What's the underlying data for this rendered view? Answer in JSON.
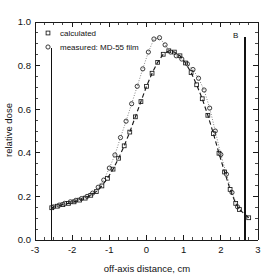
{
  "chart_data": {
    "type": "line",
    "title": "",
    "xlabel": "off-axis distance, cm",
    "ylabel": "relative dose",
    "xlim": [
      -3,
      3
    ],
    "ylim": [
      0.0,
      1.0
    ],
    "xticks": [
      "-3",
      "-2",
      "-1",
      "0",
      "1",
      "2",
      "3"
    ],
    "xtick_values": [
      -3,
      -2,
      -1,
      0,
      1,
      2,
      3
    ],
    "yticks": [
      "0.0",
      "0.2",
      "0.4",
      "0.6",
      "0.8",
      "1.0"
    ],
    "ytick_values": [
      0.0,
      0.2,
      0.4,
      0.6,
      0.8,
      1.0
    ],
    "grid": false,
    "minor_ticks": true,
    "legend_position": "top-left",
    "legend": [
      {
        "label": "calculated",
        "marker": "square",
        "linestyle": "dashed"
      },
      {
        "label": "measured: MD-55 film",
        "marker": "circle",
        "linestyle": "dotted"
      }
    ],
    "annotations": [
      {
        "text": "B",
        "x": 2.4,
        "y": 0.925
      }
    ],
    "vertical_lines": [
      {
        "x": -2.55,
        "y_from": 0.0,
        "y_to": 0.88
      },
      {
        "x": 2.65,
        "y_from": 0.0,
        "y_to": 0.93
      }
    ],
    "series": [
      {
        "name": "calculated",
        "marker": "square",
        "linestyle": "dashed",
        "x": [
          -2.55,
          -2.4,
          -2.25,
          -2.1,
          -1.95,
          -1.8,
          -1.65,
          -1.5,
          -1.35,
          -1.2,
          -1.05,
          -0.9,
          -0.75,
          -0.6,
          -0.45,
          -0.3,
          -0.15,
          0.0,
          0.15,
          0.3,
          0.45,
          0.6,
          0.75,
          0.9,
          1.05,
          1.2,
          1.35,
          1.5,
          1.65,
          1.8,
          1.95,
          2.1,
          2.25,
          2.4,
          2.5,
          2.75
        ],
        "y": [
          0.148,
          0.155,
          0.162,
          0.168,
          0.175,
          0.183,
          0.192,
          0.205,
          0.222,
          0.248,
          0.283,
          0.325,
          0.375,
          0.432,
          0.495,
          0.565,
          0.635,
          0.705,
          0.765,
          0.815,
          0.852,
          0.868,
          0.862,
          0.845,
          0.812,
          0.768,
          0.712,
          0.648,
          0.572,
          0.488,
          0.398,
          0.312,
          0.232,
          0.168,
          0.14,
          0.102
        ]
      },
      {
        "name": "measured: MD-55 film",
        "marker": "circle",
        "linestyle": "dotted",
        "x": [
          -2.5,
          -2.35,
          -2.2,
          -2.05,
          -1.9,
          -1.75,
          -1.6,
          -1.45,
          -1.3,
          -1.15,
          -1.0,
          -0.85,
          -0.7,
          -0.55,
          -0.4,
          -0.25,
          -0.1,
          0.05,
          0.2,
          0.35,
          0.5,
          0.65,
          0.8,
          0.95,
          1.1,
          1.25,
          1.4,
          1.55,
          1.7,
          1.85,
          2.0,
          2.15,
          2.3,
          2.45
        ],
        "y": [
          0.152,
          0.16,
          0.168,
          0.175,
          0.182,
          0.19,
          0.2,
          0.215,
          0.242,
          0.275,
          0.33,
          0.39,
          0.47,
          0.545,
          0.625,
          0.705,
          0.785,
          0.862,
          0.922,
          0.928,
          0.895,
          0.862,
          0.845,
          0.83,
          0.808,
          0.782,
          0.742,
          0.688,
          0.605,
          0.5,
          0.392,
          0.302,
          0.218,
          0.152
        ]
      }
    ]
  },
  "figure": {
    "annotation_b": "B"
  }
}
